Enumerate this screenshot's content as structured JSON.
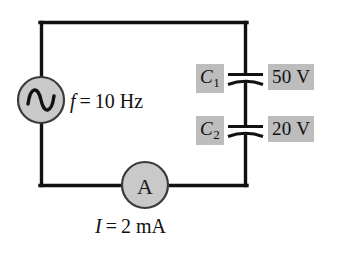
{
  "figure": {
    "background_color": "#ffffff",
    "wire_color": "#111111",
    "component_fill": "#c9c9c9",
    "highlight_color": "#bdbdbd"
  },
  "source": {
    "symbol_name": "ac-source-sine",
    "frequency_label": {
      "variable": "f",
      "equals": "=",
      "value": "10 Hz",
      "full_text": "f = 10 Hz"
    }
  },
  "ammeter": {
    "letter": "A",
    "current_label": {
      "variable": "I",
      "equals": "=",
      "value": "2 mA",
      "full_text": "I = 2 mA"
    }
  },
  "capacitors": [
    {
      "name": "C",
      "subscript": "1",
      "voltage": "50 V"
    },
    {
      "name": "C",
      "subscript": "2",
      "voltage": "20 V"
    }
  ]
}
